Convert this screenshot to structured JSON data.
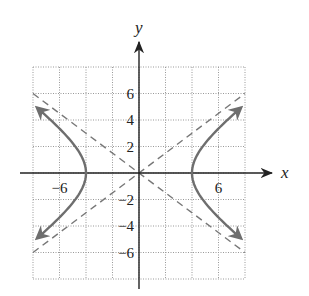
{
  "chart_data": {
    "type": "line",
    "title": "",
    "xlabel": "x",
    "ylabel": "y",
    "xlim": [
      -8,
      8
    ],
    "ylim": [
      -8,
      8
    ],
    "grid": true,
    "grid_step": 2,
    "x_tick_labels": [
      {
        "value": -6,
        "label": "−6"
      },
      {
        "value": 6,
        "label": "6"
      }
    ],
    "y_tick_labels": [
      {
        "value": 6,
        "label": "6"
      },
      {
        "value": 4,
        "label": "4"
      },
      {
        "value": 2,
        "label": "2"
      },
      {
        "value": -2,
        "label": "−2"
      },
      {
        "value": -4,
        "label": "−4"
      },
      {
        "value": -6,
        "label": "−6"
      }
    ],
    "series": [
      {
        "name": "hyperbola",
        "equation": "x^2/16 - y^2/9 = 1",
        "a": 4,
        "b": 3,
        "style": "solid",
        "arrows": true,
        "x_extent": 7.7,
        "color": "#6e6e6e"
      },
      {
        "name": "asymptote-positive",
        "equation": "y = 3x/4",
        "style": "dashed",
        "color": "#777777"
      },
      {
        "name": "asymptote-negative",
        "equation": "y = -3x/4",
        "style": "dashed",
        "color": "#777777"
      }
    ],
    "legend": null
  },
  "colors": {
    "axis": "#222222",
    "grid": "#999999",
    "curve": "#6e6e6e",
    "asymptote": "#777777"
  }
}
